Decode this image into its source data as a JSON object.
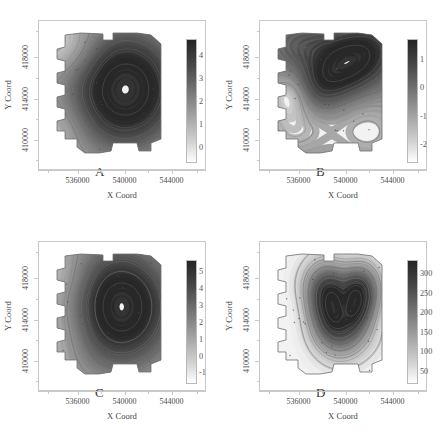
{
  "figure": {
    "type": "multi-panel-contour-map",
    "panel_count": 4,
    "background_color": "#ffffff",
    "colormap": "grayscale-dark-high"
  },
  "axes": {
    "xlabel": "X Coord",
    "ylabel": "Y Coord",
    "xticks": [
      "536000",
      "540000",
      "544000"
    ],
    "yticks": [
      "410000",
      "414000",
      "418000"
    ],
    "xlim": [
      534200,
      545800
    ],
    "ylim": [
      408200,
      420400
    ]
  },
  "panels": [
    {
      "letter": "A",
      "cbar_ticks": [
        "4",
        "3",
        "2",
        "1",
        "0"
      ],
      "cbar_min": -0.4,
      "cbar_max": 4.6
    },
    {
      "letter": "B",
      "cbar_ticks": [
        "1",
        "0",
        "-1",
        "-2"
      ],
      "cbar_min": -2.6,
      "cbar_max": 1.8
    },
    {
      "letter": "C",
      "cbar_ticks": [
        "5",
        "4",
        "3",
        "2",
        "1",
        "0",
        "-1"
      ],
      "cbar_min": -1.4,
      "cbar_max": 5.6
    },
    {
      "letter": "D",
      "cbar_ticks": [
        "300",
        "250",
        "200",
        "150",
        "100",
        "50"
      ],
      "cbar_min": 10,
      "cbar_max": 340
    }
  ],
  "chart_data": {
    "type": "heatmap",
    "title": "",
    "xlabel": "X Coord",
    "ylabel": "Y Coord",
    "xlim": [
      534200,
      545800
    ],
    "ylim": [
      408200,
      420400
    ],
    "grid": false,
    "legend": "colorbar-right-of-each-panel",
    "panels": [
      {
        "label": "A",
        "colorbar_ticks": [
          0,
          1,
          2,
          3,
          4
        ],
        "value_range": [
          -0.4,
          4.6
        ],
        "contour_levels": [
          0,
          1,
          2,
          3,
          4
        ],
        "description": "smooth single broad high centered right-of-center; low values along western edge",
        "hotspots": [
          {
            "x": 542100,
            "y": 415200,
            "value": 4.4
          }
        ],
        "lows": [
          {
            "x": 535600,
            "y": 418600,
            "value": 0.2
          }
        ]
      },
      {
        "label": "B",
        "colorbar_ticks": [
          -2,
          -1,
          0,
          1
        ],
        "value_range": [
          -2.6,
          1.8
        ],
        "contour_levels": [
          -2,
          -1,
          0,
          1
        ],
        "description": "diagonal band of high values running NW to SE across the centre; isolated low pocket in the west",
        "hotspots": [
          {
            "x": 540600,
            "y": 416200,
            "value": 1.5
          }
        ],
        "lows": [
          {
            "x": 536300,
            "y": 413900,
            "value": -2.3
          }
        ]
      },
      {
        "label": "C",
        "colorbar_ticks": [
          -1,
          0,
          1,
          2,
          3,
          4,
          5
        ],
        "value_range": [
          -1.4,
          5.6
        ],
        "contour_levels": [
          -1,
          0,
          1,
          2,
          3,
          4,
          5
        ],
        "description": "large central-eastern plateau of high values; gradient falling toward the western margin",
        "hotspots": [
          {
            "x": 541500,
            "y": 415600,
            "value": 5.3
          }
        ],
        "lows": [
          {
            "x": 535800,
            "y": 412400,
            "value": -0.9
          }
        ]
      },
      {
        "label": "D",
        "colorbar_ticks": [
          50,
          100,
          150,
          200,
          250,
          300
        ],
        "value_range": [
          10,
          340
        ],
        "contour_levels": [
          50,
          100,
          150,
          200,
          250,
          300
        ],
        "description": "two strong concentric hotspots in the east separated by a narrow saddle; broad uniform low over the entire western half",
        "hotspots": [
          {
            "x": 540600,
            "y": 415300,
            "value": 330
          },
          {
            "x": 542900,
            "y": 416000,
            "value": 300
          }
        ],
        "lows": [
          {
            "x": 536000,
            "y": 412800,
            "value": 25
          }
        ]
      }
    ]
  }
}
